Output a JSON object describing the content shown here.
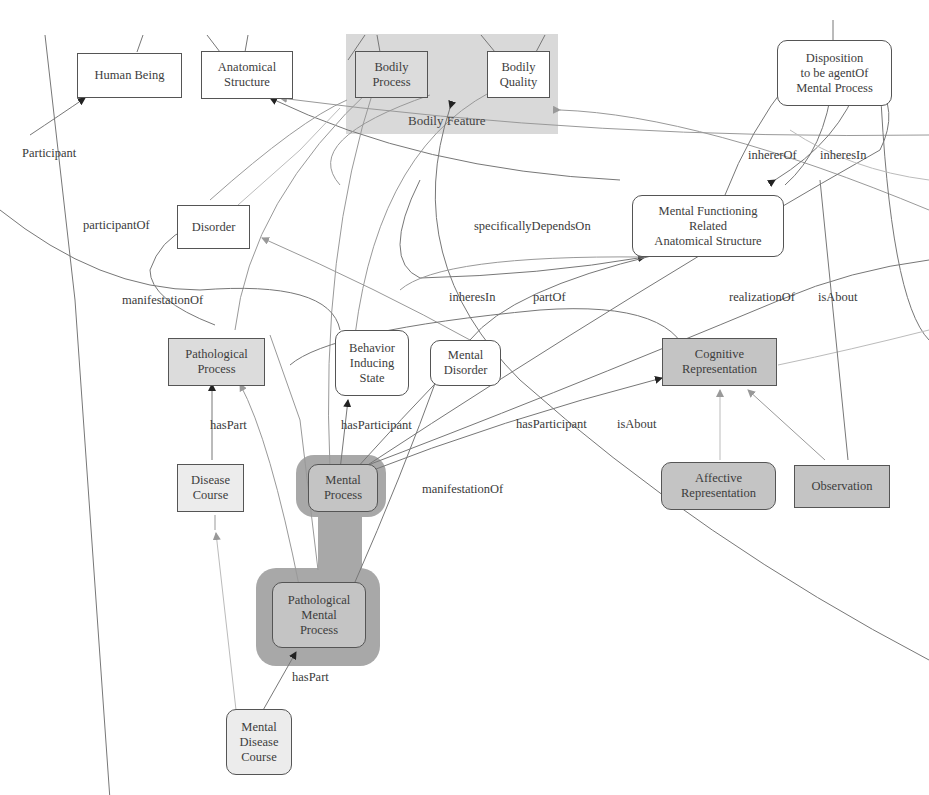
{
  "diagram": {
    "type": "ontology-graph",
    "cluster": {
      "label": "Bodily Feature",
      "color": "#d9d9d9"
    },
    "nodes": {
      "human_being": "Human Being",
      "anatomical_structure": "Anatomical\nStructure",
      "bodily_process": "Bodily\nProcess",
      "bodily_quality": "Bodily\nQuality",
      "disposition": "Disposition\nto be agentOf\nMental Process",
      "disorder": "Disorder",
      "mfras": "Mental Functioning\nRelated\nAnatomical Structure",
      "pathological_process": "Pathological\nProcess",
      "behavior_inducing_state": "Behavior\nInducing\nState",
      "mental_disorder": "Mental\nDisorder",
      "cognitive_representation": "Cognitive\nRepresentation",
      "disease_course": "Disease\nCourse",
      "mental_process": "Mental\nProcess",
      "affective_representation": "Affective\nRepresentation",
      "observation": "Observation",
      "pathological_mental_process": "Pathological\nMental\nProcess",
      "mental_disease_course": "Mental\nDisease\nCourse"
    },
    "edge_labels": {
      "participant": "Participant",
      "participant_of": "participantOf",
      "manifestation_of_1": "manifestationOf",
      "specifically_depends_on": "specificallyDependsOn",
      "inherer_of": "inhererOf",
      "inheres_in_1": "inheresIn",
      "inheres_in_2": "inheresIn",
      "part_of": "partOf",
      "realization_of": "realizationOf",
      "is_about_1": "isAbout",
      "has_part_1": "hasPart",
      "has_participant_1": "hasParticipant",
      "has_participant_2": "hasParticipant",
      "is_about_2": "isAbout",
      "manifestation_of_2": "manifestationOf",
      "has_part_2": "hasPart"
    },
    "colors": {
      "edge": "#6a6a6a",
      "light_edge": "#a5a5a5",
      "node_border": "#555555",
      "highlight": "#a8a8a8"
    }
  }
}
